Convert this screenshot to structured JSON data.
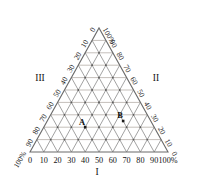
{
  "figure": {
    "type": "ternary-diagram",
    "background_color": "#ffffff",
    "outline_color": "#6b6b6b",
    "grid_color_diagonal": "#8a8a8a",
    "grid_color_horizontal": "#b9b4ad",
    "node_color": "#5a5a5a",
    "marker_color": "#1a1a1a"
  },
  "chart_data": {
    "type": "ternary",
    "title": "",
    "axes": [
      {
        "id": "I",
        "label": "I",
        "position": "bottom",
        "direction": "left-to-right",
        "ticks": [
          "0",
          "10",
          "20",
          "30",
          "40",
          "50",
          "60",
          "70",
          "80",
          "90",
          "100%"
        ],
        "values": [
          0,
          10,
          20,
          30,
          40,
          50,
          60,
          70,
          80,
          90,
          100
        ]
      },
      {
        "id": "II",
        "label": "II",
        "position": "right",
        "direction": "top-to-bottom",
        "ticks": [
          "100%",
          "90",
          "80",
          "70",
          "60",
          "50",
          "40",
          "30",
          "20",
          "10",
          "0"
        ],
        "values": [
          100,
          90,
          80,
          70,
          60,
          50,
          40,
          30,
          20,
          10,
          0
        ]
      },
      {
        "id": "III",
        "label": "III",
        "position": "left",
        "direction": "bottom-to-top",
        "ticks": [
          "100%",
          "90",
          "80",
          "70",
          "60",
          "50",
          "40",
          "30",
          "20",
          "10",
          "0"
        ],
        "values": [
          100,
          90,
          80,
          70,
          60,
          50,
          40,
          30,
          20,
          10,
          0
        ]
      }
    ],
    "grid": {
      "divisions": 10,
      "show": true,
      "node_dots": true
    },
    "points": [
      {
        "label": "A",
        "I": 30,
        "II": 20,
        "III": 50
      },
      {
        "label": "B",
        "I": 55,
        "II": 25,
        "III": 20
      }
    ],
    "axis_tick_labels_bottom": [
      "0",
      "10",
      "20",
      "30",
      "40",
      "50",
      "60",
      "70",
      "80",
      "90",
      "100%"
    ],
    "axis_tick_labels_left": [
      "100%",
      "90",
      "80",
      "70",
      "60",
      "50",
      "40",
      "30",
      "20",
      "10",
      "0"
    ],
    "axis_tick_labels_right": [
      "100%",
      "90",
      "80",
      "70",
      "60",
      "50",
      "40",
      "30",
      "20",
      "10",
      "0"
    ],
    "corner_labels": [
      "I",
      "II",
      "III"
    ],
    "point_labels": [
      "A",
      "B"
    ]
  }
}
